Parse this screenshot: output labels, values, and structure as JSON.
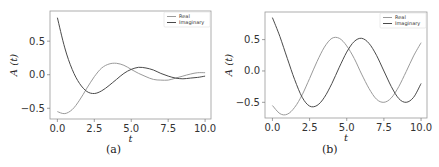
{
  "chart_data": [
    {
      "type": "line",
      "panel": "a",
      "caption": "(a)",
      "title": "",
      "xlabel": "t",
      "ylabel": "A (t)",
      "xlim": [
        -0.5,
        10.4
      ],
      "ylim": [
        -0.66,
        0.95
      ],
      "xticks": [
        0.0,
        2.5,
        5.0,
        7.5,
        10.0
      ],
      "xtick_labels": [
        "0.0",
        "2.5",
        "5.0",
        "7.5",
        "10.0"
      ],
      "yticks": [
        -0.5,
        0.0,
        0.5
      ],
      "ytick_labels": [
        "−0.5",
        "0.0",
        "0.5"
      ],
      "grid": false,
      "legend_position": "upper right",
      "x": [
        0,
        0.5,
        1,
        1.5,
        2,
        2.5,
        3,
        3.5,
        4,
        4.5,
        5,
        5.5,
        6,
        6.5,
        7,
        7.5,
        8,
        8.5,
        9,
        9.5,
        10
      ],
      "series": [
        {
          "name": "Real",
          "color": "#9a9a9a",
          "values": [
            -0.55,
            -0.58,
            -0.52,
            -0.38,
            -0.2,
            -0.03,
            0.1,
            0.16,
            0.17,
            0.14,
            0.08,
            0.02,
            -0.03,
            -0.07,
            -0.08,
            -0.08,
            -0.05,
            -0.02,
            0.01,
            0.03,
            0.03
          ]
        },
        {
          "name": "Imaginary",
          "color": "#4a4a4a",
          "values": [
            0.85,
            0.4,
            0.08,
            -0.13,
            -0.25,
            -0.28,
            -0.24,
            -0.16,
            -0.07,
            0.02,
            0.08,
            0.11,
            0.1,
            0.07,
            0.02,
            -0.02,
            -0.05,
            -0.06,
            -0.05,
            -0.04,
            -0.02
          ]
        }
      ]
    },
    {
      "type": "line",
      "panel": "b",
      "caption": "(b)",
      "title": "",
      "xlabel": "t",
      "ylabel": "A (t)",
      "xlim": [
        -0.5,
        10.4
      ],
      "ylim": [
        -0.75,
        0.94
      ],
      "xticks": [
        0.0,
        2.5,
        5.0,
        7.5,
        10.0
      ],
      "xtick_labels": [
        "0.0",
        "2.5",
        "5.0",
        "7.5",
        "10.0"
      ],
      "yticks": [
        -0.5,
        0.0,
        0.5
      ],
      "ytick_labels": [
        "−0.5",
        "0.0",
        "0.5"
      ],
      "grid": false,
      "legend_position": "upper right",
      "x": [
        0,
        0.5,
        1,
        1.5,
        2,
        2.5,
        3,
        3.5,
        4,
        4.5,
        5,
        5.5,
        6,
        6.5,
        7,
        7.5,
        8,
        8.5,
        9,
        9.5,
        10
      ],
      "series": [
        {
          "name": "Real",
          "color": "#9a9a9a",
          "values": [
            -0.55,
            -0.68,
            -0.69,
            -0.58,
            -0.38,
            -0.12,
            0.15,
            0.38,
            0.52,
            0.52,
            0.4,
            0.2,
            -0.05,
            -0.28,
            -0.45,
            -0.5,
            -0.43,
            -0.25,
            -0.01,
            0.24,
            0.45
          ]
        },
        {
          "name": "Imaginary",
          "color": "#4a4a4a",
          "values": [
            0.85,
            0.55,
            0.2,
            -0.14,
            -0.42,
            -0.56,
            -0.55,
            -0.42,
            -0.2,
            0.06,
            0.3,
            0.47,
            0.52,
            0.44,
            0.25,
            0.0,
            -0.25,
            -0.44,
            -0.5,
            -0.42,
            -0.2
          ]
        }
      ]
    }
  ],
  "captions": {
    "a": "(a)",
    "b": "(b)"
  }
}
